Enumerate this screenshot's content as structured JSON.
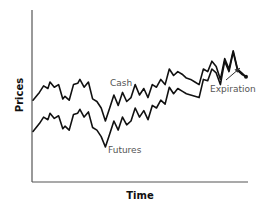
{
  "chart_data": {
    "type": "line",
    "title": "",
    "xlabel": "Time",
    "ylabel": "Prices",
    "grid": false,
    "legend": "none (inline labels)",
    "annotations": [
      {
        "text": "Cash",
        "target": "Cash series"
      },
      {
        "text": "Futures",
        "target": "Futures series"
      },
      {
        "text": "Expiration",
        "arrow_to": "converged endpoint"
      }
    ],
    "note": "Conceptual chart, no tick values shown; points are relative (x: 0-100 time, y: 0-100 price) traced from the image.",
    "x": [
      0,
      3,
      5,
      7,
      8,
      10,
      12,
      14,
      15,
      17,
      19,
      21,
      22,
      24,
      26,
      28,
      30,
      32,
      34,
      36,
      38,
      40,
      42,
      44,
      46,
      48,
      50,
      52,
      54,
      56,
      58,
      60,
      62,
      64,
      66,
      68,
      70,
      72,
      74,
      76,
      78,
      80,
      82,
      84,
      86,
      88,
      90,
      92,
      94,
      96,
      98,
      100
    ],
    "series": [
      {
        "name": "Cash",
        "values": [
          46,
          52,
          57,
          55,
          60,
          56,
          58,
          47,
          49,
          46,
          58,
          59,
          62,
          56,
          60,
          47,
          45,
          40,
          30,
          40,
          50,
          42,
          52,
          45,
          48,
          58,
          50,
          55,
          48,
          58,
          56,
          62,
          58,
          70,
          65,
          68,
          66,
          63,
          62,
          60,
          58,
          70,
          68,
          76,
          72,
          62,
          78,
          70,
          84,
          70,
          67,
          64
        ]
      },
      {
        "name": "Futures",
        "values": [
          22,
          28,
          33,
          31,
          36,
          32,
          34,
          24,
          26,
          23,
          35,
          36,
          39,
          33,
          37,
          25,
          23,
          18,
          10,
          20,
          30,
          23,
          33,
          27,
          30,
          40,
          33,
          38,
          31,
          42,
          40,
          46,
          43,
          56,
          51,
          55,
          53,
          51,
          50,
          49,
          48,
          62,
          61,
          70,
          67,
          58,
          76,
          68,
          83,
          69,
          66,
          64
        ]
      }
    ]
  },
  "labels": {
    "y_axis": "Prices",
    "x_axis": "Time",
    "cash": "Cash",
    "futures": "Futures",
    "expiration": "Expiration"
  },
  "colors": {
    "line": "#111111",
    "axis": "#555555",
    "annotation": "#555555"
  }
}
